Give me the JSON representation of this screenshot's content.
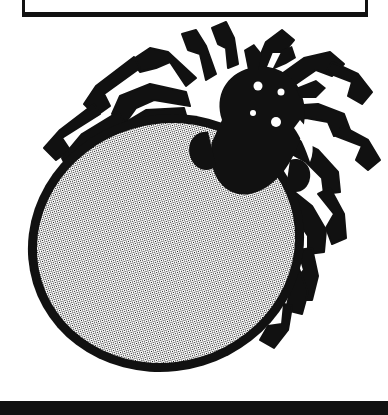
{
  "page": {
    "width": 388,
    "height": 415,
    "background_color": "#ffffff",
    "ink_color": "#111111",
    "title": "Tick illustration plate"
  },
  "frame_box": {
    "name": "partial-border-box",
    "visible_portion": "bottom edge and lower side walls of a rectangular rule box, clipped by the top of the page",
    "left": 22,
    "right": 368,
    "bottom_y": 16,
    "stroke_width": 3,
    "color": "#111111"
  },
  "bottom_bar": {
    "name": "solid-rule",
    "top_y": 401,
    "height": 14,
    "color": "#111111"
  },
  "illustration": {
    "subject": "tick",
    "style": "black-and-white halftone line drawing",
    "orientation": "body tilted, cephalothorax toward upper right",
    "outline_color": "#111111",
    "fill_pattern": "halftone-dot-screen",
    "fill_tone_percent": 50,
    "halftone_dot_pitch_px": 2,
    "parts": [
      {
        "name": "abdomen",
        "shape": "large tilted oval",
        "fill": "halftone",
        "outline_width_px": 9
      },
      {
        "name": "cephalothorax",
        "shape": "rounded dark mass",
        "fill": "solid-black"
      },
      {
        "name": "eyes",
        "count": 4,
        "fill": "white"
      },
      {
        "name": "legs",
        "count": 8,
        "fill": "solid-black",
        "style": "jointed angular segments"
      },
      {
        "name": "pedipalps",
        "count": 2,
        "fill": "solid-black"
      }
    ]
  }
}
